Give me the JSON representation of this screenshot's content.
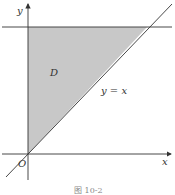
{
  "figure": {
    "caption": "图 10-2",
    "labels": {
      "y_axis": "y",
      "x_axis": "x",
      "origin": "O",
      "region": "D",
      "line": "y = x"
    },
    "colors": {
      "region_fill": "#c8c8c8",
      "line": "#333333",
      "background": "#ffffff"
    }
  }
}
